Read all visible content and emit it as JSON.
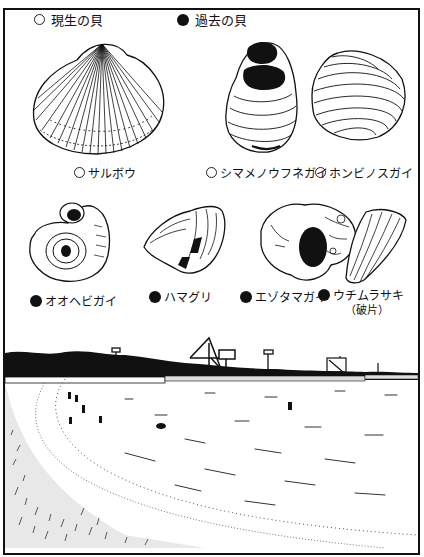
{
  "page": {
    "title_partial": "（上端が切れたタイトル）"
  },
  "legend": {
    "living": {
      "symbol": "open-circle",
      "label": "現生の貝"
    },
    "past": {
      "symbol": "filled-circle",
      "label": "過去の貝"
    }
  },
  "shells": [
    {
      "id": "saruboo",
      "label": "サルボウ",
      "status": "living"
    },
    {
      "id": "shimamesuunegai",
      "label": "シマメノウフネガイ",
      "status": "living"
    },
    {
      "id": "honbirisugai",
      "label": "ホンビノスガイ",
      "status": "living"
    },
    {
      "id": "oohebigai",
      "label": "オオヘビガイ",
      "status": "past"
    },
    {
      "id": "hamaguri",
      "label": "ハマグリ",
      "status": "past"
    },
    {
      "id": "ezotamagai",
      "label": "エゾタマガイ",
      "status": "past"
    },
    {
      "id": "uchimurasaki",
      "label": "ウチムラサキ",
      "sublabel": "（破片）",
      "status": "past"
    }
  ],
  "scene": {
    "description": "beach-landscape",
    "colors": {
      "ink": "#111111",
      "paper": "#ffffff"
    }
  }
}
